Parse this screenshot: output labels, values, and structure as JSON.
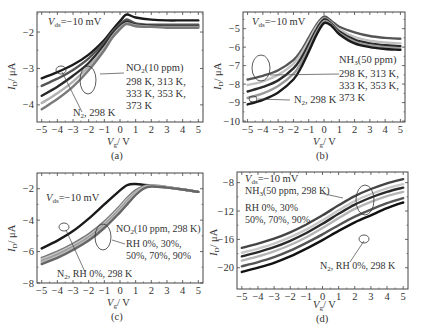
{
  "chart_data": [
    {
      "id": "a",
      "type": "line",
      "caption": "(a)",
      "title": "",
      "vds_label": "−10 mV",
      "xlabel": "Vg/V",
      "ylabel": "ID/μA",
      "xlim": [
        -5.3,
        5.3
      ],
      "ylim": [
        -4.47,
        -1.45
      ],
      "xticks": [
        -5,
        -4,
        -3,
        -2,
        -1,
        0,
        1,
        2,
        3,
        4,
        5
      ],
      "yticks": [
        -2,
        -3,
        -4
      ],
      "frame": {
        "x": 37,
        "y": 12,
        "w": 166,
        "h": 110
      },
      "annotations": [
        {
          "text": "NO2(10 ppm)",
          "sub": "2"
        },
        {
          "text": "298 K, 313 K,"
        },
        {
          "text": "333 K, 353 K,"
        },
        {
          "text": "373 K"
        },
        {
          "text": "N2, 298 K"
        }
      ],
      "x": [
        -5,
        -4,
        -3,
        -2,
        -1,
        -0.5,
        0,
        0.3,
        0.5,
        1,
        2,
        3,
        4,
        5
      ],
      "series": [
        {
          "name": "N2, 298 K",
          "color": "#1a1a1a",
          "values": [
            -3.27,
            -3.1,
            -2.9,
            -2.62,
            -2.22,
            -1.95,
            -1.7,
            -1.55,
            -1.52,
            -1.6,
            -1.66,
            -1.68,
            -1.68,
            -1.68
          ]
        },
        {
          "name": "NO2 298 K",
          "color": "#555555",
          "values": [
            -3.48,
            -3.28,
            -3.04,
            -2.72,
            -2.28,
            -2.0,
            -1.78,
            -1.68,
            -1.66,
            -1.76,
            -1.8,
            -1.8,
            -1.8,
            -1.8
          ]
        },
        {
          "name": "NO2 313 K",
          "color": "#2a2a2a",
          "values": [
            -3.75,
            -3.5,
            -3.2,
            -2.85,
            -2.36,
            -2.06,
            -1.84,
            -1.74,
            -1.72,
            -1.8,
            -1.83,
            -1.84,
            -1.84,
            -1.84
          ]
        },
        {
          "name": "NO2 333 K",
          "color": "#b0b0b0",
          "values": [
            -3.95,
            -3.68,
            -3.36,
            -2.95,
            -2.44,
            -2.12,
            -1.88,
            -1.78,
            -1.76,
            -1.82,
            -1.85,
            -1.86,
            -1.86,
            -1.86
          ]
        },
        {
          "name": "NO2 353 K",
          "color": "#7a7a7a",
          "values": [
            -4.12,
            -3.84,
            -3.5,
            -3.05,
            -2.5,
            -2.16,
            -1.92,
            -1.8,
            -1.78,
            -1.84,
            -1.86,
            -1.88,
            -1.88,
            -1.88
          ]
        }
      ]
    },
    {
      "id": "b",
      "type": "line",
      "caption": "(b)",
      "title": "",
      "vds_label": "−10 mV",
      "xlabel": "Vg/V",
      "ylabel": "ID/μA",
      "xlim": [
        -5.3,
        5.3
      ],
      "ylim": [
        -10.05,
        -4.1
      ],
      "xticks": [
        -5,
        -4,
        -3,
        -2,
        -1,
        0,
        1,
        2,
        3,
        4,
        5
      ],
      "yticks": [
        -5,
        -6,
        -7,
        -8,
        -9,
        -10
      ],
      "frame": {
        "x": 243,
        "y": 12,
        "w": 162,
        "h": 110
      },
      "annotations": [
        {
          "text": "NH3(50 ppm)",
          "sub": "3"
        },
        {
          "text": "298 K, 313 K,"
        },
        {
          "text": "333 K, 353 K,"
        },
        {
          "text": "373 K"
        },
        {
          "text": "N2, 298 K"
        }
      ],
      "x": [
        -5,
        -4,
        -3,
        -2,
        -1.5,
        -1,
        -0.5,
        0,
        0.5,
        1,
        2,
        3,
        4,
        5
      ],
      "series": [
        {
          "name": "N2, 298 K",
          "color": "#555555",
          "values": [
            -7.75,
            -7.55,
            -7.25,
            -6.7,
            -6.2,
            -5.5,
            -4.8,
            -4.35,
            -4.6,
            -4.9,
            -5.2,
            -5.4,
            -5.5,
            -5.55
          ]
        },
        {
          "name": "NH3 298 K",
          "color": "#c0c0c0",
          "values": [
            -8.05,
            -7.85,
            -7.5,
            -6.9,
            -6.35,
            -5.65,
            -4.9,
            -4.45,
            -4.7,
            -5.05,
            -5.45,
            -5.65,
            -5.75,
            -5.8
          ]
        },
        {
          "name": "NH3 313 K",
          "color": "#2a2a2a",
          "values": [
            -8.4,
            -8.15,
            -7.8,
            -7.15,
            -6.6,
            -5.85,
            -5.05,
            -4.5,
            -4.75,
            -5.15,
            -5.6,
            -5.8,
            -5.9,
            -5.95
          ]
        },
        {
          "name": "NH3 333 K",
          "color": "#9a9a9a",
          "values": [
            -8.75,
            -8.5,
            -8.1,
            -7.45,
            -6.85,
            -6.05,
            -5.2,
            -4.6,
            -4.8,
            -5.25,
            -5.7,
            -5.9,
            -6.0,
            -6.05
          ]
        },
        {
          "name": "NH3 353 K",
          "color": "#1a1a1a",
          "values": [
            -9.1,
            -8.85,
            -8.45,
            -7.75,
            -7.1,
            -6.25,
            -5.35,
            -4.7,
            -4.85,
            -5.3,
            -5.8,
            -6.0,
            -6.1,
            -6.15
          ]
        }
      ]
    },
    {
      "id": "c",
      "type": "line",
      "caption": "(c)",
      "title": "",
      "vds_label": "−10 mV",
      "xlabel": "Vg/V",
      "ylabel": "ID/μA",
      "xlim": [
        -5.3,
        5.3
      ],
      "ylim": [
        -8.0,
        -1.0
      ],
      "xticks": [
        -5,
        -4,
        -3,
        -2,
        -1,
        0,
        1,
        2,
        3,
        4,
        5
      ],
      "yticks": [
        -2,
        -4,
        -6,
        -8
      ],
      "frame": {
        "x": 37,
        "y": 173,
        "w": 166,
        "h": 110
      },
      "annotations": [
        {
          "text": "NO2(10 ppm, 298 K)",
          "sub": "2"
        },
        {
          "text": "RH 0%, 30%,"
        },
        {
          "text": "50%, 70%, 90%"
        },
        {
          "text": "N2, RH 0%, 298 K"
        }
      ],
      "x": [
        -5,
        -4,
        -3,
        -2,
        -1,
        0,
        0.5,
        1,
        1.5,
        2,
        3,
        4,
        5
      ],
      "series": [
        {
          "name": "N2, RH 0%, 298 K",
          "color": "#1a1a1a",
          "values": [
            -5.8,
            -5.3,
            -4.7,
            -3.9,
            -3.0,
            -2.1,
            -1.75,
            -1.7,
            -1.75,
            -1.8,
            -1.9,
            -2.05,
            -2.2
          ]
        },
        {
          "name": "NO2 RH 0%",
          "color": "#777777",
          "values": [
            -6.4,
            -6.0,
            -5.5,
            -4.9,
            -4.1,
            -3.1,
            -2.55,
            -2.1,
            -1.85,
            -1.78,
            -1.9,
            -2.05,
            -2.2
          ]
        },
        {
          "name": "NO2 RH 30%",
          "color": "#c8c8c8",
          "values": [
            -6.5,
            -6.1,
            -5.6,
            -5.0,
            -4.2,
            -3.2,
            -2.65,
            -2.2,
            -1.9,
            -1.8,
            -1.9,
            -2.05,
            -2.2
          ]
        },
        {
          "name": "NO2 RH 50%",
          "color": "#999999",
          "values": [
            -6.6,
            -6.2,
            -5.7,
            -5.1,
            -4.3,
            -3.3,
            -2.75,
            -2.25,
            -1.92,
            -1.82,
            -1.92,
            -2.05,
            -2.2
          ]
        },
        {
          "name": "NO2 RH 70%",
          "color": "#bbbbbb",
          "values": [
            -6.7,
            -6.3,
            -5.8,
            -5.2,
            -4.4,
            -3.4,
            -2.85,
            -2.3,
            -1.95,
            -1.84,
            -1.92,
            -2.05,
            -2.2
          ]
        },
        {
          "name": "NO2 RH 90%",
          "color": "#666666",
          "values": [
            -6.8,
            -6.4,
            -5.9,
            -5.3,
            -4.5,
            -3.5,
            -2.95,
            -2.4,
            -2.0,
            -1.86,
            -1.93,
            -2.05,
            -2.2
          ]
        }
      ]
    },
    {
      "id": "d",
      "type": "line",
      "caption": "(d)",
      "title": "",
      "vds_label": "−10 mV",
      "xlabel": "Vg/V",
      "ylabel": "ID/μA",
      "xlim": [
        -5.3,
        5.3
      ],
      "ylim": [
        -23.0,
        -6.5
      ],
      "xticks": [
        -5,
        -4,
        -3,
        -2,
        -1,
        0,
        1,
        2,
        3,
        4,
        5
      ],
      "yticks": [
        -8,
        -12,
        -16,
        -20
      ],
      "frame": {
        "x": 237,
        "y": 172,
        "w": 171,
        "h": 117
      },
      "annotations": [
        {
          "text": "NH3(50 ppm, 298 K)",
          "sub": "3"
        },
        {
          "text": "RH 0%, 30%"
        },
        {
          "text": "50%, 70%, 90%"
        },
        {
          "text": "N2, RH 0%, 298 K"
        }
      ],
      "x": [
        -5,
        -4,
        -3,
        -2,
        -1,
        0,
        1,
        2,
        3,
        4,
        5
      ],
      "series": [
        {
          "name": "NH3 RH 0%",
          "color": "#444444",
          "values": [
            -17.2,
            -16.6,
            -15.9,
            -15.0,
            -13.9,
            -12.6,
            -11.2,
            -9.9,
            -8.9,
            -8.1,
            -7.5
          ]
        },
        {
          "name": "NH3 RH 30%",
          "color": "#c8c8c8",
          "values": [
            -17.9,
            -17.3,
            -16.6,
            -15.7,
            -14.6,
            -13.3,
            -11.9,
            -10.6,
            -9.6,
            -8.8,
            -8.2
          ]
        },
        {
          "name": "NH3 RH 50%",
          "color": "#2a2a2a",
          "values": [
            -18.4,
            -17.8,
            -17.1,
            -16.2,
            -15.1,
            -13.8,
            -12.4,
            -11.1,
            -10.1,
            -9.3,
            -8.7
          ]
        },
        {
          "name": "NH3 RH 70%",
          "color": "#b5b5b5",
          "values": [
            -19.0,
            -18.4,
            -17.7,
            -16.8,
            -15.7,
            -14.4,
            -13.0,
            -11.7,
            -10.7,
            -9.9,
            -9.3
          ]
        },
        {
          "name": "NH3 RH 90%",
          "color": "#555555",
          "values": [
            -19.8,
            -19.2,
            -18.5,
            -17.6,
            -16.5,
            -15.3,
            -14.0,
            -12.8,
            -11.8,
            -10.9,
            -10.2
          ]
        },
        {
          "name": "N2, RH 0%, 298 K",
          "color": "#111111",
          "values": [
            -20.6,
            -20.0,
            -19.3,
            -18.4,
            -17.3,
            -16.1,
            -14.8,
            -13.6,
            -12.6,
            -11.6,
            -10.8
          ]
        }
      ]
    }
  ],
  "labels": {
    "vds_prefix": "V",
    "vds_sub": "ds",
    "vds_value": "=−10 mV",
    "ylabel_main": "I",
    "ylabel_sub": "D",
    "ylabel_unit": "/ μA",
    "xlabel_main": "V",
    "xlabel_sub": "g",
    "xlabel_unit": "/ V",
    "a": {
      "gas": "NO",
      "gas_sub": "2",
      "gas_rest": "(10 ppm)",
      "temps1": "298 K, 313 K,",
      "temps2": "333 K, 353 K,",
      "temps3": "373 K",
      "n2_main": "N",
      "n2_sub": "2",
      "n2_rest": ", 298 K",
      "caption": "(a)"
    },
    "b": {
      "gas": "NH",
      "gas_sub": "3",
      "gas_rest": "(50 ppm)",
      "temps1": "298 K, 313 K,",
      "temps2": "333 K, 353 K,",
      "temps3": "373 K",
      "n2_main": "N",
      "n2_sub": "2",
      "n2_rest": ", 298 K",
      "caption": "(b)"
    },
    "c": {
      "gas": "NO",
      "gas_sub": "2",
      "gas_rest": "(10 ppm, 298 K)",
      "rh1": "RH 0%, 30%,",
      "rh2": "50%, 70%, 90%",
      "n2_main": "N",
      "n2_sub": "2",
      "n2_rest": ", RH 0%, 298 K",
      "caption": "(c)"
    },
    "d": {
      "gas": "NH",
      "gas_sub": "3",
      "gas_rest": "(50 ppm, 298 K)",
      "rh1": "RH 0%, 30%",
      "rh2": "50%, 70%, 90%",
      "n2_main": "N",
      "n2_sub": "2",
      "n2_rest": ", RH 0%, 298 K",
      "caption": "(d)"
    }
  }
}
